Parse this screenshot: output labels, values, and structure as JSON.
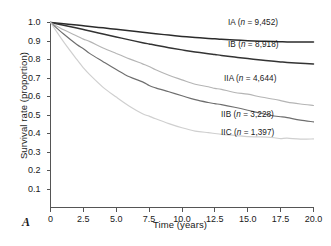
{
  "panel": {
    "label": "A"
  },
  "axes": {
    "ylabel": "Survival rate (proportion)",
    "xlabel": "Time (years)",
    "yticks": [
      "1.0",
      "0.9",
      "0.8",
      "0.7",
      "0.6",
      "0.5",
      "0.4",
      "0.3",
      "0.2",
      "0.1"
    ],
    "xticks": [
      "0",
      "2.5",
      "5.0",
      "7.5",
      "10.0",
      "12.5",
      "15.0",
      "17.5",
      "20.0"
    ]
  },
  "labels": {
    "ia": "IA (n = 9,452)",
    "ib": "IB (n = 8,918)",
    "iia": "IIA (n = 4,644)",
    "iib": "IIB (n = 3,228)",
    "iic": "IIC (n = 1,397)"
  },
  "colors": {
    "ia": "#2b2b2b",
    "ib": "#333333",
    "iia": "#b5b5b5",
    "iib": "#6e6e6e",
    "iic": "#cfcfcf",
    "axis": "#555555",
    "text": "#1a1a1a"
  },
  "chart_data": {
    "type": "line",
    "title": "",
    "xlabel": "Time (years)",
    "ylabel": "Survival rate (proportion)",
    "xlim": [
      0,
      20
    ],
    "ylim": [
      0,
      1.0
    ],
    "grid": false,
    "legend_position": "inline-right-of-curves",
    "x": [
      0,
      1,
      2,
      2.5,
      3,
      4,
      5,
      6,
      7,
      7.5,
      8,
      9,
      10,
      11,
      12,
      12.5,
      13,
      14,
      15,
      16,
      17,
      17.5,
      18,
      19,
      20
    ],
    "series": [
      {
        "name": "IA",
        "label": "IA (n = 9,452)",
        "n": 9452,
        "color": "#2b2b2b",
        "values": [
          1.0,
          0.993,
          0.986,
          0.982,
          0.978,
          0.971,
          0.963,
          0.955,
          0.947,
          0.943,
          0.939,
          0.932,
          0.925,
          0.919,
          0.914,
          0.912,
          0.909,
          0.905,
          0.902,
          0.899,
          0.897,
          0.896,
          0.895,
          0.895,
          0.895
        ]
      },
      {
        "name": "IB",
        "label": "IB (n = 8,918)",
        "n": 8918,
        "color": "#333333",
        "values": [
          1.0,
          0.985,
          0.97,
          0.962,
          0.954,
          0.938,
          0.922,
          0.906,
          0.891,
          0.884,
          0.877,
          0.864,
          0.852,
          0.841,
          0.831,
          0.827,
          0.822,
          0.813,
          0.805,
          0.797,
          0.79,
          0.787,
          0.784,
          0.78,
          0.776
        ]
      },
      {
        "name": "IIA",
        "label": "IIA (n = 4,644)",
        "n": 4644,
        "color": "#b5b5b5",
        "values": [
          1.0,
          0.963,
          0.928,
          0.911,
          0.894,
          0.862,
          0.832,
          0.803,
          0.776,
          0.762,
          0.745,
          0.712,
          0.688,
          0.668,
          0.651,
          0.643,
          0.636,
          0.622,
          0.61,
          0.597,
          0.585,
          0.578,
          0.572,
          0.562,
          0.552
        ]
      },
      {
        "name": "IIB",
        "label": "IIB (n = 3,228)",
        "n": 3228,
        "color": "#6e6e6e",
        "values": [
          1.0,
          0.938,
          0.882,
          0.856,
          0.831,
          0.786,
          0.745,
          0.709,
          0.677,
          0.662,
          0.648,
          0.624,
          0.603,
          0.585,
          0.57,
          0.563,
          0.556,
          0.542,
          0.528,
          0.512,
          0.497,
          0.49,
          0.484,
          0.474,
          0.465
        ]
      },
      {
        "name": "IIC",
        "label": "IIC (n = 1,397)",
        "n": 1397,
        "color": "#cfcfcf",
        "values": [
          1.0,
          0.893,
          0.8,
          0.758,
          0.719,
          0.651,
          0.594,
          0.548,
          0.51,
          0.494,
          0.479,
          0.452,
          0.43,
          0.416,
          0.405,
          0.401,
          0.397,
          0.39,
          0.384,
          0.379,
          0.375,
          0.373,
          0.372,
          0.37,
          0.369
        ]
      }
    ]
  }
}
